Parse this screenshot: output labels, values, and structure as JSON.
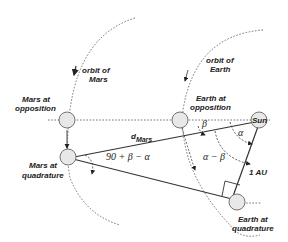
{
  "diagram": {
    "labels": {
      "orbit_mars": [
        "orbit of",
        "Mars"
      ],
      "orbit_earth": [
        "orbit of",
        "Earth"
      ],
      "mars_opposition": [
        "Mars at",
        "opposition"
      ],
      "earth_opposition": [
        "Earth at",
        "opposition"
      ],
      "mars_quadrature": [
        "Mars at",
        "quadrature"
      ],
      "earth_quadrature": [
        "Earth at",
        "quadrature"
      ],
      "sun": "Sun",
      "d_mars_main": "d",
      "d_mars_sub": "Mars",
      "angle_quadrature": "90 + β − α",
      "beta": "β",
      "alpha": "α",
      "alpha_minus_beta": "α − β",
      "distance_au": "1 AU"
    },
    "bodies": [
      {
        "name": "Mars at opposition"
      },
      {
        "name": "Earth at opposition"
      },
      {
        "name": "Sun"
      },
      {
        "name": "Mars at quadrature"
      },
      {
        "name": "Earth at quadrature"
      }
    ]
  }
}
